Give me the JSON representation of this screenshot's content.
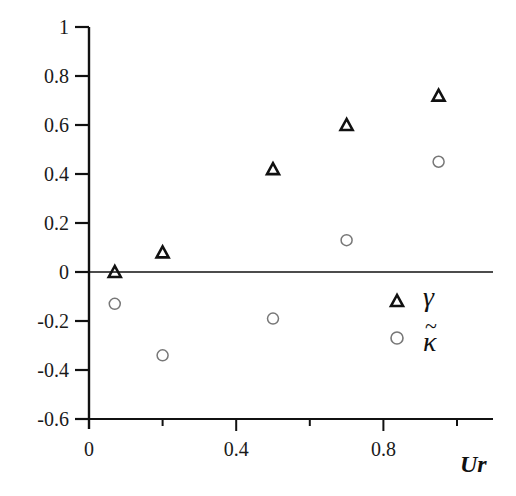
{
  "chart_data": {
    "type": "scatter",
    "title": "",
    "xlabel": "Ur",
    "ylabel": "",
    "xlim": [
      0,
      1.1
    ],
    "ylim": [
      -0.6,
      1.0
    ],
    "grid": false,
    "legend_position": "lower right",
    "x_ticks": [
      {
        "value": 0,
        "label": "0"
      },
      {
        "value": 0.2,
        "label": ""
      },
      {
        "value": 0.4,
        "label": "0.4"
      },
      {
        "value": 0.6,
        "label": ""
      },
      {
        "value": 0.8,
        "label": "0.8"
      },
      {
        "value": 1.0,
        "label": ""
      }
    ],
    "y_ticks": [
      {
        "value": 1,
        "label": "1"
      },
      {
        "value": 0.8,
        "label": "0.8"
      },
      {
        "value": 0.6,
        "label": "0.6"
      },
      {
        "value": 0.4,
        "label": "0.4"
      },
      {
        "value": 0.2,
        "label": "0.2"
      },
      {
        "value": 0,
        "label": "0"
      },
      {
        "value": -0.2,
        "label": "-0.2"
      },
      {
        "value": -0.4,
        "label": "-0.4"
      },
      {
        "value": -0.6,
        "label": "-0.6"
      }
    ],
    "reference_lines": [
      {
        "axis": "y",
        "value": 0
      }
    ],
    "series": [
      {
        "name": "γ",
        "marker": "triangle",
        "x": [
          0.07,
          0.2,
          0.5,
          0.7,
          0.95
        ],
        "y": [
          0.0,
          0.08,
          0.42,
          0.6,
          0.72
        ]
      },
      {
        "name": "κ̃",
        "marker": "circle",
        "x": [
          0.07,
          0.2,
          0.5,
          0.7,
          0.95
        ],
        "y": [
          -0.13,
          -0.34,
          -0.19,
          0.13,
          0.45
        ]
      }
    ]
  },
  "legend": {
    "items": [
      {
        "marker": "triangle",
        "label": "γ"
      },
      {
        "marker": "circle",
        "label": "κ",
        "accent": "~"
      }
    ]
  },
  "colors": {
    "axis": "#111111",
    "triangle": "#111111",
    "circle": "#777777"
  }
}
